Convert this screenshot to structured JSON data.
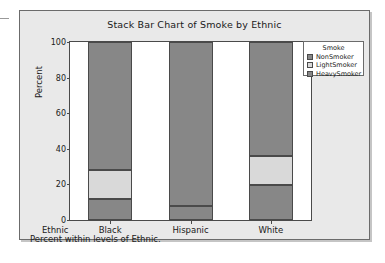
{
  "chart_data": {
    "type": "bar",
    "subtype": "stacked-percent",
    "title": "Stack Bar Chart of Smoke by Ethnic",
    "xlabel": "Ethnic",
    "ylabel": "Percent",
    "ylim": [
      0,
      100
    ],
    "yticks": [
      0,
      20,
      40,
      60,
      80,
      100
    ],
    "grid": false,
    "legend_position": "right",
    "legend_title": "Smoke",
    "footnote": "Percent within levels of Ethnic.",
    "categories": [
      "Black",
      "Hispanic",
      "White"
    ],
    "series": [
      {
        "name": "HeavySmoker",
        "color": "#878787",
        "values": [
          12,
          8,
          19.5
        ]
      },
      {
        "name": "LightSmoker",
        "color": "#d9d9d9",
        "values": [
          16,
          0,
          16.5
        ]
      },
      {
        "name": "NonSmoker",
        "color": "#878787",
        "values": [
          72,
          92,
          64
        ]
      }
    ]
  },
  "legend": {
    "title": "Smoke",
    "entries": [
      {
        "label": "NonSmoker",
        "color": "#878787"
      },
      {
        "label": "LightSmoker",
        "color": "#d9d9d9"
      },
      {
        "label": "HeavySmoker",
        "color": "#878787"
      }
    ]
  },
  "axes": {
    "y_title": "Percent",
    "y_ticks": [
      "0",
      "20",
      "40",
      "60",
      "80",
      "100"
    ],
    "x_name": "Ethnic",
    "x_ticks": [
      "Black",
      "Hispanic",
      "White"
    ]
  },
  "title": "Stack Bar Chart of Smoke by Ethnic",
  "footnote": "Percent within levels of Ethnic."
}
